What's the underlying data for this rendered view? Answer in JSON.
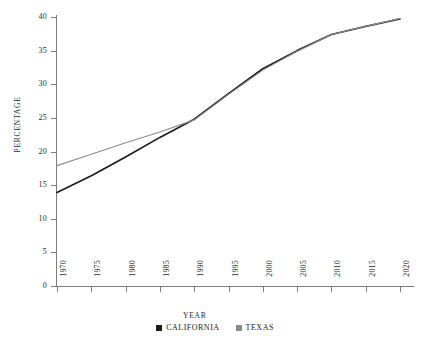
{
  "chart_data": {
    "type": "line",
    "title": "",
    "xlabel": "YEAR",
    "ylabel": "PERCENTAGE",
    "xlim": [
      1970,
      2020
    ],
    "ylim": [
      0,
      40
    ],
    "grid": false,
    "legend_position": "bottom-center",
    "x": [
      1970,
      1975,
      1980,
      1985,
      1990,
      1995,
      2000,
      2005,
      2010,
      2015,
      2020
    ],
    "xticklabels": [
      "1970",
      "1975",
      "1980",
      "1985",
      "1990",
      "1995",
      "2000",
      "2005",
      "2010",
      "2015",
      "2020"
    ],
    "yticks": [
      0,
      5,
      10,
      15,
      20,
      25,
      30,
      35,
      40
    ],
    "yticklabels": [
      "0",
      "5",
      "10",
      "15",
      "20",
      "25",
      "30",
      "35",
      "40"
    ],
    "series": [
      {
        "name": "CALIFORNIA",
        "color": "#1c1c1c",
        "values": [
          13.9,
          16.4,
          19.2,
          22.1,
          24.8,
          28.6,
          32.3,
          35.0,
          37.4,
          38.6,
          39.7
        ]
      },
      {
        "name": "TEXAS",
        "color": "#8c8c8c",
        "values": [
          17.9,
          19.6,
          21.3,
          22.9,
          24.7,
          28.5,
          32.1,
          34.9,
          37.4,
          38.6,
          39.8
        ]
      }
    ]
  },
  "legend": {
    "items": [
      {
        "label": "CALIFORNIA",
        "color": "#1c1c1c"
      },
      {
        "label": "TEXAS",
        "color": "#8c8c8c"
      }
    ]
  },
  "axes": {
    "x_title": "YEAR",
    "y_title": "PERCENTAGE"
  }
}
